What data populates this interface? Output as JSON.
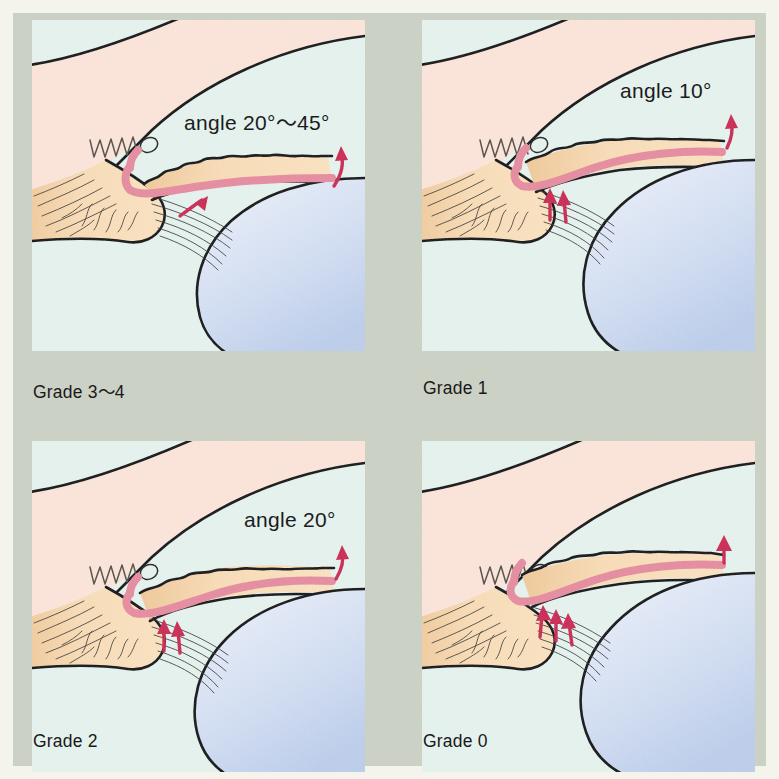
{
  "figure": {
    "paper_color": "#f4f3ec",
    "plate_color": "#ccd1c5",
    "panel_background": "#e4f1ec"
  },
  "palette": {
    "cornea_sclera": "#fae3d9",
    "aqueous": "#e4f1ec",
    "iris": "#f6d7b0",
    "iris_shadow": "#ecc596",
    "lens_light": "#e6edf8",
    "lens_dark": "#c3d3ee",
    "pink_band": "#e58ca0",
    "arrow_red": "#ca2d55",
    "ink": "#1a1a1c",
    "hair": "#4a463f"
  },
  "panels": [
    {
      "id": "grade34",
      "caption": "Grade 3〜4",
      "angle_label": "angle 20°〜45°",
      "has_angle_label": true,
      "angle_degrees_min": 20,
      "angle_degrees_max": 45,
      "arrow_count": 2,
      "description": "Wide open angle, iris flat and well away from trabecular meshwork"
    },
    {
      "id": "grade1",
      "caption": "Grade 1",
      "angle_label": "angle 10°",
      "has_angle_label": true,
      "angle_degrees_min": 10,
      "angle_degrees_max": 10,
      "arrow_count": 3,
      "description": "Extremely narrow angle, closure probable"
    },
    {
      "id": "grade2",
      "caption": "Grade 2",
      "angle_label": "angle 20°",
      "has_angle_label": true,
      "angle_degrees_min": 20,
      "angle_degrees_max": 20,
      "arrow_count": 3,
      "description": "Narrow angle, closure possible"
    },
    {
      "id": "grade0",
      "caption": "Grade 0",
      "angle_label": "",
      "has_angle_label": false,
      "angle_degrees_min": 0,
      "angle_degrees_max": 0,
      "arrow_count": 4,
      "description": "Closed angle, iris in contact with trabecular meshwork"
    }
  ],
  "structures": [
    {
      "name": "cornea",
      "color": "#fae3d9"
    },
    {
      "name": "sclera",
      "color": "#fae3d9"
    },
    {
      "name": "anterior-chamber",
      "color": "#e4f1ec"
    },
    {
      "name": "iris",
      "color": "#f6d7b0"
    },
    {
      "name": "ciliary-body",
      "color": "#f6d7b0"
    },
    {
      "name": "lens",
      "color": "#c3d3ee"
    },
    {
      "name": "trabecular-meshwork",
      "color": "#575249"
    },
    {
      "name": "schlemms-canal",
      "color": "#fae3d9"
    },
    {
      "name": "zonular-fibers",
      "color": "#3a3a3c"
    },
    {
      "name": "posterior-iris-pigment",
      "color": "#e58ca0"
    },
    {
      "name": "aqueous-flow-arrow",
      "color": "#ca2d55"
    }
  ]
}
